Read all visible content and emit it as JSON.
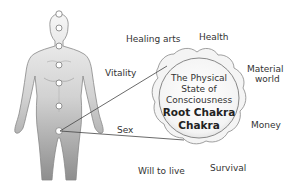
{
  "diagram": {
    "center": {
      "line1": "The Physical",
      "line2": "State of",
      "line3": "Consciousness",
      "title1": "Root Chakra",
      "title2": "Chakra"
    },
    "labels": {
      "healing_arts": "Healing arts",
      "health": "Health",
      "vitality": "Vitality",
      "material1": "Material",
      "material2": "world",
      "money": "Money",
      "sex": "Sex",
      "will_to_live": "Will to live",
      "survival": "Survival"
    },
    "colors": {
      "figure_top": "#f2f2f2",
      "figure_bottom": "#9a9a9a",
      "outline": "#777777",
      "text": "#333333"
    }
  }
}
